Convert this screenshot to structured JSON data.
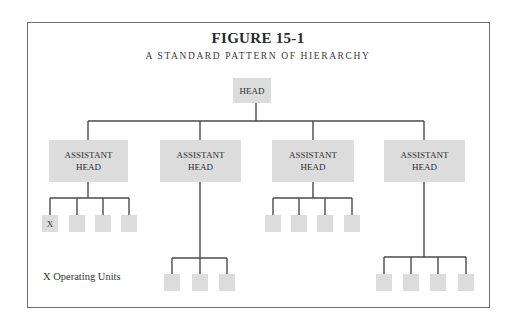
{
  "figure": {
    "title": "FIGURE 15-1",
    "subtitle": "A STANDARD PATTERN OF HIERARCHY"
  },
  "nodes": {
    "head": {
      "label": "HEAD"
    },
    "assistants": [
      {
        "line1": "ASSISTANT",
        "line2": "HEAD",
        "units": 4
      },
      {
        "line1": "ASSISTANT",
        "line2": "HEAD",
        "units": 3
      },
      {
        "line1": "ASSISTANT",
        "line2": "HEAD",
        "units": 4
      },
      {
        "line1": "ASSISTANT",
        "line2": "HEAD",
        "units": 4
      }
    ],
    "unit_marker": "X"
  },
  "legend": {
    "text": "X Operating Units"
  },
  "colors": {
    "box_fill": "#dcdcdc",
    "line": "#4a4a4a",
    "frame": "#6e6e6e"
  }
}
